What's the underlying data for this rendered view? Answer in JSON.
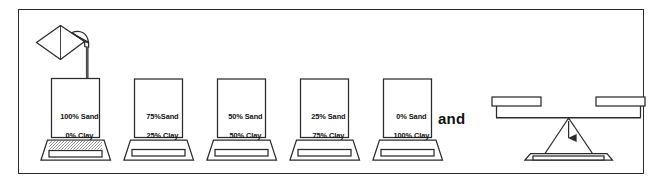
{
  "figure": {
    "conjunction": "and",
    "border_color": "#2b2b2b",
    "line_color": "#2b2b2b",
    "background": "#ffffff",
    "fill_color": "#ffffff"
  },
  "pouring_vessel": {
    "name": "watering-can",
    "description": "tilted pitcher pouring a stream into the first container"
  },
  "containers": [
    {
      "index": 1,
      "sand_label": "100% Sand",
      "clay_label": "0% Clay",
      "sand_percent": 100,
      "clay_percent": 0,
      "tray_has_spill": true,
      "being_poured_into": true
    },
    {
      "index": 2,
      "sand_label": "75%Sand",
      "clay_label": "25% Clay",
      "sand_percent": 75,
      "clay_percent": 25,
      "tray_has_spill": false,
      "being_poured_into": false
    },
    {
      "index": 3,
      "sand_label": "50% Sand",
      "clay_label": "50% Clay",
      "sand_percent": 50,
      "clay_percent": 50,
      "tray_has_spill": false,
      "being_poured_into": false
    },
    {
      "index": 4,
      "sand_label": "25% Sand",
      "clay_label": "75% Clay",
      "sand_percent": 25,
      "clay_percent": 75,
      "tray_has_spill": false,
      "being_poured_into": false
    },
    {
      "index": 5,
      "sand_label": "0% Sand",
      "clay_label": "100% Clay",
      "sand_percent": 0,
      "clay_percent": 100,
      "tray_has_spill": false,
      "being_poured_into": false
    }
  ],
  "balance": {
    "name": "balance-scale",
    "left_pan": "empty",
    "right_pan": "empty",
    "pivot_arrow": "down-arrow",
    "base": "tripod-stand"
  }
}
